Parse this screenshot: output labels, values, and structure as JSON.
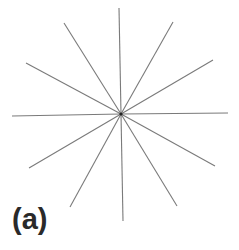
{
  "figure": {
    "panel_label": "(a)",
    "line_color": "#7a7a7a",
    "center_color": "#222222",
    "center": [
      121,
      114
    ],
    "rays": [
      {
        "name": "up",
        "end": [
          119,
          8
        ]
      },
      {
        "name": "up-right-1",
        "end": [
          173,
          22
        ]
      },
      {
        "name": "up-right-2",
        "end": [
          213,
          60
        ]
      },
      {
        "name": "right",
        "end": [
          228,
          113
        ]
      },
      {
        "name": "down-right-1",
        "end": [
          215,
          166
        ]
      },
      {
        "name": "down-right-2",
        "end": [
          177,
          206
        ]
      },
      {
        "name": "down",
        "end": [
          123,
          221
        ]
      },
      {
        "name": "down-left-2",
        "end": [
          70,
          207
        ]
      },
      {
        "name": "down-left-1",
        "end": [
          29,
          168
        ]
      },
      {
        "name": "left",
        "end": [
          12,
          116
        ]
      },
      {
        "name": "up-left-2",
        "end": [
          26,
          63
        ]
      },
      {
        "name": "up-left-1",
        "end": [
          64,
          23
        ]
      }
    ]
  }
}
